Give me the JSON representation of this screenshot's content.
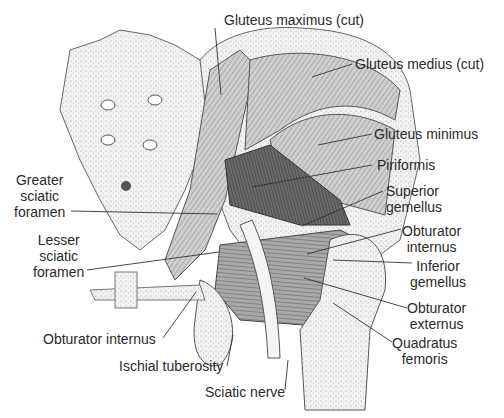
{
  "figure": {
    "labels": [
      {
        "id": "gluteus-maximus-cut",
        "text": "Gluteus maximus (cut)"
      },
      {
        "id": "gluteus-medius-cut",
        "text": "Gluteus medius (cut)"
      },
      {
        "id": "gluteus-minimus",
        "text": "Gluteus minimus"
      },
      {
        "id": "piriformis",
        "text": "Piriformis"
      },
      {
        "id": "superior-gemellus",
        "text": "Superior\ngemellus"
      },
      {
        "id": "obturator-internus-right",
        "text": "Obturator\ninternus"
      },
      {
        "id": "inferior-gemellus",
        "text": "Inferior\ngemellus"
      },
      {
        "id": "obturator-externus",
        "text": "Obturator\nexternus"
      },
      {
        "id": "quadratus-femoris",
        "text": "Quadratus\nfemoris"
      },
      {
        "id": "greater-sciatic-foramen",
        "text": "Greater\nsciatic\nforamen"
      },
      {
        "id": "lesser-sciatic-foramen",
        "text": "Lesser\nsciatic\nforamen"
      },
      {
        "id": "obturator-internus-left",
        "text": "Obturator internus"
      },
      {
        "id": "ischial-tuberosity",
        "text": "Ischial tuberosity"
      },
      {
        "id": "sciatic-nerve",
        "text": "Sciatic nerve"
      }
    ]
  }
}
